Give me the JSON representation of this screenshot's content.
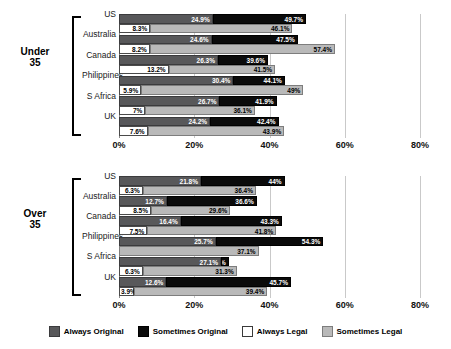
{
  "chart_data": {
    "type": "bar",
    "orientation": "horizontal",
    "stacked": true,
    "title": "",
    "xlabel": "",
    "ylabel": "",
    "xlim": [
      0,
      80
    ],
    "xticks": [
      "0%",
      "20%",
      "40%",
      "60%",
      "80%"
    ],
    "xtick_values": [
      0,
      20,
      40,
      60,
      80
    ],
    "grid": true,
    "legend_position": "bottom",
    "legend": [
      {
        "name": "Always Original",
        "color": "#58585a"
      },
      {
        "name": "Sometimes Original",
        "color": "#0b0b0b"
      },
      {
        "name": "Always Legal",
        "color": "#ffffff"
      },
      {
        "name": "Sometimes Legal",
        "color": "#b9b9b9"
      }
    ],
    "note": "Segment labels show cumulative end-of-segment percentages.",
    "groups": [
      {
        "name": "Under 35",
        "label_line1": "Under",
        "label_line2": "35",
        "categories": [
          "US",
          "Australia",
          "Canada",
          "Philippines",
          "S Africa",
          "UK"
        ],
        "series": [
          {
            "name": "Always Original",
            "values": [
              24.9,
              24.6,
              26.3,
              30.4,
              26.7,
              24.2
            ],
            "labels": [
              "24.9%",
              "24.6%",
              "26.3%",
              "30.4%",
              "26.7%",
              "24.2%"
            ]
          },
          {
            "name": "Sometimes Original",
            "values": [
              49.7,
              47.5,
              39.6,
              44.1,
              41.9,
              42.4
            ],
            "labels": [
              "49.7%",
              "47.5%",
              "39.6%",
              "44.1%",
              "41.9%",
              "42.4%"
            ]
          },
          {
            "name": "Always Legal",
            "values": [
              8.3,
              8.2,
              13.2,
              5.9,
              7.0,
              7.6
            ],
            "labels": [
              "8.3%",
              "8.2%",
              "13.2%",
              "5.9%",
              "7%",
              "7.6%"
            ]
          },
          {
            "name": "Sometimes Legal",
            "values": [
              46.1,
              57.4,
              41.5,
              49.0,
              36.1,
              43.9
            ],
            "labels": [
              "46.1%",
              "57.4%",
              "41.5%",
              "49%",
              "36.1%",
              "43.9%"
            ]
          }
        ]
      },
      {
        "name": "Over 35",
        "label_line1": "Over",
        "label_line2": "35",
        "categories": [
          "US",
          "Australia",
          "Canada",
          "Philippines",
          "S Africa",
          "UK"
        ],
        "series": [
          {
            "name": "Always Original",
            "values": [
              21.8,
              12.7,
              16.4,
              25.7,
              27.1,
              12.6
            ],
            "labels": [
              "21.8%",
              "12.7%",
              "16.4%",
              "25.7%",
              "27.1%",
              "12.6%"
            ]
          },
          {
            "name": "Sometimes Original",
            "values": [
              44.0,
              36.6,
              43.3,
              54.3,
              29.2,
              45.7
            ],
            "labels": [
              "44%",
              "36.6%",
              "43.3%",
              "54.3%",
              "29.2%",
              "45.7%"
            ]
          },
          {
            "name": "Always Legal",
            "values": [
              6.3,
              8.5,
              7.5,
              0.0,
              6.3,
              3.9
            ],
            "labels": [
              "6.3%",
              "8.5%",
              "7.5%",
              "0%",
              "6.3%",
              "3.9%"
            ]
          },
          {
            "name": "Sometimes Legal",
            "values": [
              36.4,
              29.6,
              41.8,
              37.1,
              31.3,
              39.4
            ],
            "labels": [
              "36.4%",
              "29.6%",
              "41.8%",
              "37.1%",
              "31.3%",
              "39.4%"
            ]
          }
        ]
      }
    ]
  }
}
